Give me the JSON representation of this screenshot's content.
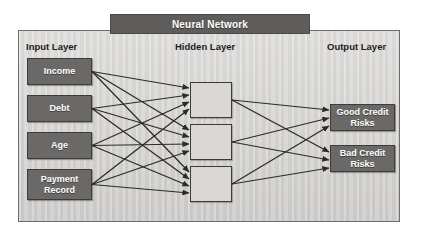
{
  "title": {
    "text": "Neural Network"
  },
  "captions": {
    "input": "Input Layer",
    "hidden": "Hidden Layer",
    "output": "Output Layer"
  },
  "input_layer": {
    "nodes": [
      {
        "label": "Income"
      },
      {
        "label": "Debt"
      },
      {
        "label": "Age"
      },
      {
        "label": "Payment Record"
      }
    ]
  },
  "hidden_layer": {
    "nodes": [
      {
        "label": ""
      },
      {
        "label": ""
      },
      {
        "label": ""
      }
    ]
  },
  "output_layer": {
    "nodes": [
      {
        "label": "Good Credit Risks"
      },
      {
        "label": "Bad Credit Risks"
      }
    ]
  },
  "colors": {
    "node_fill": "#6a6967",
    "node_text": "#ffffff",
    "hidden_fill": "#d9d8d6",
    "panel_background": "#d5d4d2",
    "titlebar_fill": "#5e5d5b",
    "edge": "#2b2a28",
    "frame_border": "#6f6e6c",
    "caption_text": "#1d1c1b",
    "page_background": "#ffffff"
  },
  "edges": {
    "input_to_hidden_count": 12,
    "hidden_to_output_count": 6,
    "style": "solid-arrow",
    "direction": "left-to-right"
  }
}
